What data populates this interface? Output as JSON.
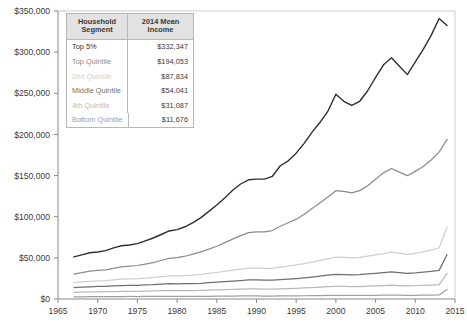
{
  "legend": {
    "header": {
      "segment": "Household\nSegment",
      "segment_line1": "Household",
      "segment_line2": "Segment",
      "income_line1": "2014 Mean",
      "income_line2": "Income"
    },
    "rows": [
      {
        "segment": "Top 5%",
        "income": "$332,347",
        "color": "#2f2f2f"
      },
      {
        "segment": "Top Quintile",
        "income": "$194,053",
        "color": "#8c8c8c"
      },
      {
        "segment": "2nd Quintile",
        "income": "$87,834",
        "color": "#cfcfcf"
      },
      {
        "segment": "Middle Quintile",
        "income": "$54,041",
        "color": "#6f6f6f"
      },
      {
        "segment": "4th Quintile",
        "income": "$31,087",
        "color": "#b9b9b9"
      },
      {
        "segment": "Bottom Quintile",
        "income": "$11,676",
        "color": "#a0a0a0"
      }
    ]
  },
  "chart_data": {
    "type": "line",
    "title": "",
    "subtitle": "",
    "xlabel": "",
    "ylabel": "",
    "xlim": [
      1965,
      2015
    ],
    "ylim": [
      0,
      350000
    ],
    "grid": false,
    "legend_position": "inside-top-left",
    "x_ticks": [
      1965,
      1970,
      1975,
      1980,
      1985,
      1990,
      1995,
      2000,
      2005,
      2010,
      2015
    ],
    "x_tick_labels": [
      "1965",
      "1970",
      "1975",
      "1980",
      "1985",
      "1990",
      "1995",
      "2000",
      "2005",
      "2010",
      "2015"
    ],
    "y_ticks": [
      0,
      50000,
      100000,
      150000,
      200000,
      250000,
      300000,
      350000
    ],
    "y_tick_labels": [
      "$0",
      "$50,000",
      "$100,000",
      "$150,000",
      "$200,000",
      "$250,000",
      "$300,000",
      "$350,000"
    ],
    "x": [
      1967,
      1968,
      1969,
      1970,
      1971,
      1972,
      1973,
      1974,
      1975,
      1976,
      1977,
      1978,
      1979,
      1980,
      1981,
      1982,
      1983,
      1984,
      1985,
      1986,
      1987,
      1988,
      1989,
      1990,
      1991,
      1992,
      1993,
      1994,
      1995,
      1996,
      1997,
      1998,
      1999,
      2000,
      2001,
      2002,
      2003,
      2004,
      2005,
      2006,
      2007,
      2008,
      2009,
      2010,
      2011,
      2012,
      2013,
      2014
    ],
    "series": [
      {
        "name": "Top 5%",
        "color": "#2f2f2f",
        "final_value": 332347,
        "values": [
          30000,
          31500,
          33000,
          33500,
          34500,
          36500,
          38000,
          38500,
          39500,
          41500,
          43500,
          46000,
          48500,
          49500,
          51500,
          54500,
          58000,
          62500,
          67000,
          72000,
          77500,
          82000,
          85000,
          85500,
          85500,
          87500,
          95000,
          98500,
          104000,
          111000,
          119000,
          126000,
          134000,
          146000,
          141000,
          138000,
          141000,
          148500,
          158000,
          167000,
          172000,
          166000,
          160000,
          169000,
          178000,
          188000,
          200000,
          195000
        ]
      },
      {
        "name": "Top Quintile",
        "color": "#8c8c8c",
        "final_value": 194053,
        "values": [
          17500,
          18500,
          19500,
          20000,
          20500,
          21500,
          22500,
          23000,
          23500,
          24500,
          25500,
          27000,
          28500,
          29000,
          30000,
          31500,
          33000,
          35000,
          37000,
          39500,
          42000,
          44500,
          46500,
          47000,
          47000,
          48000,
          51000,
          53500,
          56000,
          59500,
          63500,
          67500,
          71500,
          76000,
          75500,
          74500,
          76000,
          79500,
          84000,
          88500,
          91500,
          89000,
          86500,
          89500,
          93000,
          97500,
          103000,
          112000
        ]
      },
      {
        "name": "2nd Quintile",
        "color": "#cfcfcf",
        "final_value": 87834,
        "values": [
          11500,
          12000,
          12500,
          12800,
          13000,
          13500,
          14000,
          14200,
          14300,
          14800,
          15200,
          15800,
          16300,
          16300,
          16500,
          16800,
          17300,
          18000,
          18700,
          19500,
          20300,
          21000,
          21800,
          21800,
          21600,
          21800,
          22500,
          23200,
          24000,
          25000,
          26000,
          27200,
          28300,
          29500,
          29300,
          29000,
          29300,
          30200,
          31200,
          32000,
          33000,
          32300,
          31500,
          32200,
          33200,
          34500,
          36000,
          51000
        ]
      },
      {
        "name": "Middle Quintile",
        "color": "#6f6f6f",
        "final_value": 54041,
        "values": [
          8200,
          8500,
          8800,
          9000,
          9100,
          9400,
          9700,
          9800,
          9800,
          10100,
          10300,
          10700,
          11000,
          10900,
          11000,
          11100,
          11300,
          11700,
          12100,
          12500,
          12900,
          13300,
          13700,
          13700,
          13500,
          13600,
          13900,
          14300,
          14700,
          15200,
          15800,
          16500,
          17100,
          17700,
          17600,
          17400,
          17500,
          18000,
          18500,
          19000,
          19500,
          19000,
          18500,
          18800,
          19300,
          19900,
          20600,
          32000
        ]
      },
      {
        "name": "4th Quintile",
        "color": "#b9b9b9",
        "final_value": 31087,
        "values": [
          5000,
          5200,
          5400,
          5500,
          5550,
          5700,
          5850,
          5900,
          5880,
          6050,
          6150,
          6350,
          6500,
          6420,
          6450,
          6480,
          6550,
          6750,
          6950,
          7150,
          7350,
          7550,
          7750,
          7720,
          7600,
          7620,
          7750,
          7950,
          8150,
          8400,
          8700,
          9050,
          9350,
          9650,
          9580,
          9480,
          9500,
          9750,
          10000,
          10250,
          10500,
          10250,
          9980,
          10100,
          10350,
          10650,
          11000,
          19500
        ]
      },
      {
        "name": "Bottom Quintile",
        "color": "#a0a0a0",
        "final_value": 11676,
        "values": [
          2200,
          2280,
          2360,
          2400,
          2420,
          2480,
          2540,
          2560,
          2540,
          2600,
          2630,
          2700,
          2750,
          2700,
          2700,
          2700,
          2720,
          2790,
          2860,
          2930,
          3000,
          3070,
          3140,
          3110,
          3050,
          3050,
          3090,
          3150,
          3220,
          3310,
          3420,
          3540,
          3640,
          3740,
          3700,
          3650,
          3650,
          3730,
          3810,
          3890,
          3970,
          3870,
          3760,
          3790,
          3870,
          3970,
          4080,
          9800
        ]
      }
    ]
  },
  "axis": {
    "color": "#8a8a8a",
    "tick_label_color": "#3a3a3a"
  }
}
